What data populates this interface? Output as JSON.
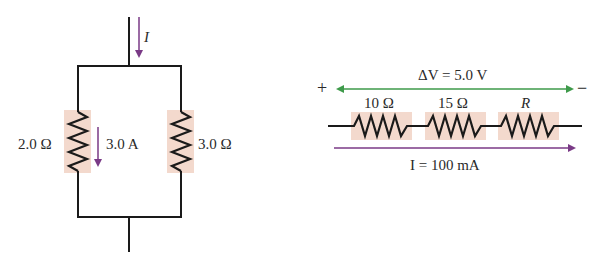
{
  "colors": {
    "wire": "#1a1a1a",
    "resistor_highlight": "#f3d9cd",
    "current_arrow": "#7a3a86",
    "voltage_arrow": "#3e9a4a"
  },
  "parallel_circuit": {
    "current_label": "I",
    "left_resistor": {
      "label": "2.0 Ω"
    },
    "branch_current": {
      "label": "3.0 A"
    },
    "right_resistor": {
      "label": "3.0 Ω"
    }
  },
  "series_circuit": {
    "voltage_label": "ΔV = 5.0 V",
    "plus_sign": "+",
    "minus_sign": "−",
    "resistors": [
      {
        "label": "10 Ω"
      },
      {
        "label": "15 Ω"
      },
      {
        "label": "R"
      }
    ],
    "current_label": "I = 100 mA"
  }
}
